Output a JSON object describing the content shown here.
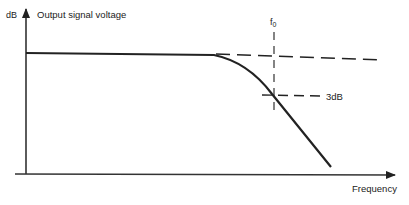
{
  "diagram": {
    "y_axis": {
      "unit_label": "dB",
      "label": "Output signal voltage"
    },
    "x_axis": {
      "label": "Frequency"
    },
    "cutoff": {
      "label": "f",
      "subscript": "0"
    },
    "attenuation_marker": {
      "label": "3dB"
    },
    "colors": {
      "ink": "#222222",
      "background": "#ffffff"
    }
  }
}
